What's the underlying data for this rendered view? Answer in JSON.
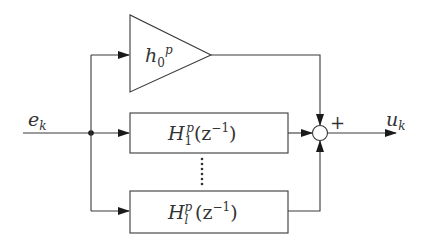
{
  "diagram": {
    "type": "block-diagram",
    "colors": {
      "line": "#3a3a3a",
      "text": "#333333",
      "background": "#ffffff"
    },
    "input_signal": {
      "symbol": "e",
      "subscript": "k"
    },
    "output_signal": {
      "symbol": "u",
      "subscript": "k"
    },
    "gain_block": {
      "symbol": "h",
      "subscript": "0",
      "superscript": "p"
    },
    "filter_blocks": [
      {
        "symbol": "H",
        "subscript": "1",
        "superscript": "p",
        "argument": "(z",
        "arg_exp": "−1",
        "arg_close": ")"
      },
      {
        "symbol": "H",
        "subscript": "l",
        "superscript": "p",
        "argument": "(z",
        "arg_exp": "−1",
        "arg_close": ")"
      }
    ],
    "summing_junction": {
      "sign": "+"
    },
    "ellipsis": "vertical-dots"
  }
}
